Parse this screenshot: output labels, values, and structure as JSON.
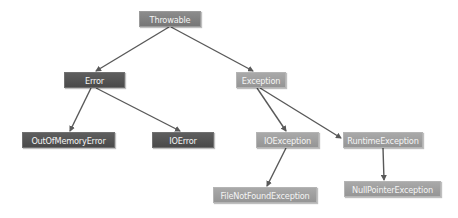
{
  "diagram": {
    "type": "class-hierarchy-tree",
    "colors": {
      "edge": "#595959",
      "dark_node": "#545454",
      "mid_node": "#808080",
      "light_node": "#9f9f9f",
      "node_text": "#f4f4f4"
    },
    "nodes": {
      "throwable": {
        "label": "Throwable"
      },
      "error": {
        "label": "Error"
      },
      "exception": {
        "label": "Exception"
      },
      "out_of_memory_error": {
        "label": "OutOfMemoryError"
      },
      "io_error": {
        "label": "IOError"
      },
      "io_exception": {
        "label": "IOException"
      },
      "runtime_exception": {
        "label": "RuntimeException"
      },
      "file_not_found_exception": {
        "label": "FileNotFoundException"
      },
      "null_pointer_exception": {
        "label": "NullPointerException"
      }
    },
    "edges": [
      {
        "from": "Throwable",
        "to": "Error"
      },
      {
        "from": "Throwable",
        "to": "Exception"
      },
      {
        "from": "Error",
        "to": "OutOfMemoryError"
      },
      {
        "from": "Error",
        "to": "IOError"
      },
      {
        "from": "Exception",
        "to": "IOException"
      },
      {
        "from": "Exception",
        "to": "RuntimeException"
      },
      {
        "from": "IOException",
        "to": "FileNotFoundException"
      },
      {
        "from": "RuntimeException",
        "to": "NullPointerException"
      }
    ]
  }
}
